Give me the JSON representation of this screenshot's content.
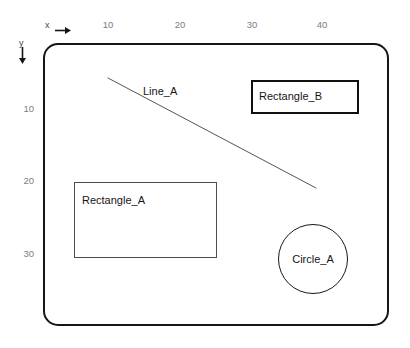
{
  "diagram": {
    "background_color": "#ffffff",
    "frame_color": "#161616",
    "axes": {
      "x": {
        "name": "x",
        "arrow": "right-arrow-icon",
        "direction": "right",
        "ticks": [
          {
            "label": "10",
            "px": 108
          },
          {
            "label": "20",
            "px": 180
          },
          {
            "label": "30",
            "px": 252
          },
          {
            "label": "40",
            "px": 322
          }
        ]
      },
      "y": {
        "name": "y",
        "arrow": "down-arrow-icon",
        "direction": "down",
        "ticks": [
          {
            "label": "10",
            "px": 108
          },
          {
            "label": "20",
            "px": 180
          },
          {
            "label": "30",
            "px": 253
          }
        ]
      }
    },
    "shapes": [
      {
        "id": "rectangle_a",
        "type": "rectangle",
        "label": "Rectangle_A",
        "stroke": "#4e4e4e",
        "stroke_width": 1,
        "x": 74,
        "y": 182,
        "width": 143,
        "height": 76
      },
      {
        "id": "rectangle_b",
        "type": "rectangle",
        "label": "Rectangle_B",
        "stroke": "#101010",
        "stroke_width": 2.4,
        "x": 251,
        "y": 80,
        "width": 108,
        "height": 34
      },
      {
        "id": "circle_a",
        "type": "circle",
        "label": "Circle_A",
        "stroke": "#171717",
        "stroke_width": 1.7,
        "cx": 313,
        "cy": 259,
        "r": 35
      },
      {
        "id": "line_a",
        "type": "line",
        "label": "Line_A",
        "stroke": "#555555",
        "stroke_width": 1,
        "x1": 108,
        "y1": 78,
        "x2": 316,
        "y2": 188
      }
    ]
  }
}
